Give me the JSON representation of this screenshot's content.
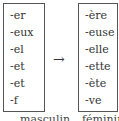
{
  "left_box": {
    "items": [
      "-er",
      "-eux",
      "-el",
      "-et",
      "-et",
      "-f"
    ]
  },
  "arrow": "→",
  "right_box": {
    "items": [
      "-ère",
      "-euse",
      "-elle",
      "-ette",
      "-ète",
      "-ve"
    ]
  },
  "captions": {
    "left": "masculin",
    "right": "féminin"
  }
}
